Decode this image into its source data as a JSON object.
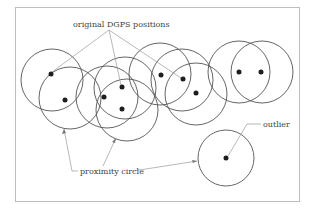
{
  "labels": {
    "positions": "original DGPS positions",
    "proximity": "proximity circle",
    "outlier": "outlier"
  },
  "colors": {
    "frame": "#bdbdbd",
    "circle": "#555555",
    "dot": "#1e1e1e",
    "leader": "#9a9a9a",
    "text": "#444444"
  },
  "points": [
    {
      "id": "p1",
      "x": 51,
      "y": 74
    },
    {
      "id": "p2",
      "x": 65,
      "y": 100
    },
    {
      "id": "p3",
      "x": 104,
      "y": 97
    },
    {
      "id": "p4",
      "x": 122,
      "y": 87
    },
    {
      "id": "p5",
      "x": 122,
      "y": 109
    },
    {
      "id": "p6",
      "x": 161,
      "y": 75
    },
    {
      "id": "p7",
      "x": 183,
      "y": 79
    },
    {
      "id": "p8",
      "x": 196,
      "y": 93
    },
    {
      "id": "p9",
      "x": 239,
      "y": 72
    },
    {
      "id": "p10",
      "x": 261,
      "y": 72
    },
    {
      "id": "outlier",
      "x": 226,
      "y": 158
    }
  ]
}
